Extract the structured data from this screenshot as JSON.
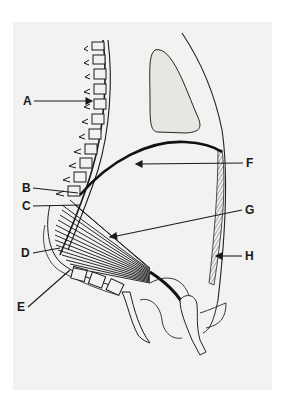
{
  "diagram": {
    "type": "anatomical-illustration",
    "colors": {
      "background": "#ffffff",
      "panel": "#f2f2f0",
      "ink": "#1a1a1a"
    },
    "labels": [
      {
        "id": "A",
        "text": "A",
        "x": 23,
        "y": 97
      },
      {
        "id": "B",
        "text": "B",
        "x": 22,
        "y": 183
      },
      {
        "id": "C",
        "text": "C",
        "x": 22,
        "y": 201
      },
      {
        "id": "D",
        "text": "D",
        "x": 21,
        "y": 248
      },
      {
        "id": "E",
        "text": "E",
        "x": 17,
        "y": 302
      },
      {
        "id": "F",
        "text": "F",
        "x": 246,
        "y": 158
      },
      {
        "id": "G",
        "text": "G",
        "x": 245,
        "y": 205
      },
      {
        "id": "H",
        "text": "H",
        "x": 245,
        "y": 251
      }
    ]
  }
}
